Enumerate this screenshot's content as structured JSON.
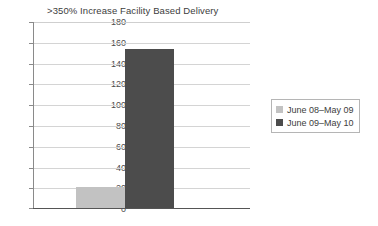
{
  "chart_data": {
    "type": "bar",
    "title": "",
    "subtitle": ">350% Increase Facility Based Delivery",
    "categories": [
      ""
    ],
    "series": [
      {
        "name": "June 08–May 09",
        "values": [
          20
        ],
        "color": "#c2c2c2"
      },
      {
        "name": "June 09–May 10",
        "values": [
          153
        ],
        "color": "#4c4c4c"
      }
    ],
    "xlabel": "",
    "ylabel": "",
    "ylim": [
      0,
      180
    ],
    "ytick_step": 20,
    "yticks": [
      "0",
      "20",
      "40",
      "60",
      "80",
      "100",
      "120",
      "140",
      "160",
      "180"
    ],
    "grid": true,
    "legend_position": "right"
  },
  "legend": {
    "items": [
      {
        "label": "June 08–May 09",
        "color": "#c2c2c2"
      },
      {
        "label": "June 09–May 10",
        "color": "#4c4c4c"
      }
    ]
  },
  "colors": {
    "series_light": "#c2c2c2",
    "series_dark": "#4c4c4c",
    "gridline": "#d4d4d4",
    "axis": "#555555",
    "text": "#3d3d3d"
  }
}
